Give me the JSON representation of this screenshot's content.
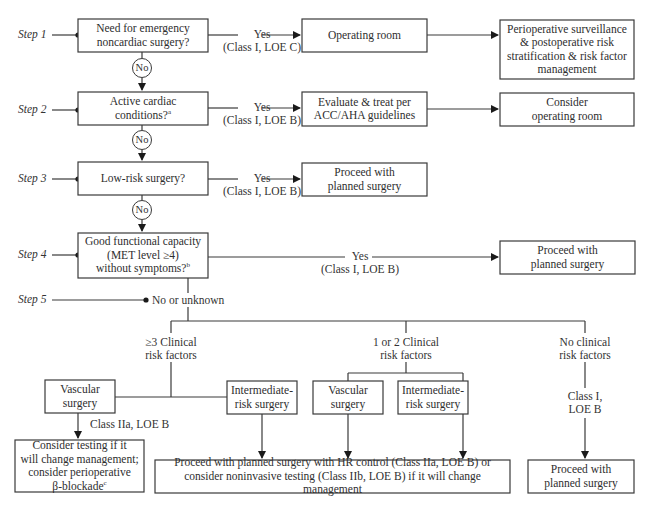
{
  "steps": [
    {
      "label": "Step 1"
    },
    {
      "label": "Step 2"
    },
    {
      "label": "Step 3"
    },
    {
      "label": "Step 4"
    },
    {
      "label": "Step 5"
    }
  ],
  "no_label": "No",
  "step1": {
    "question": [
      "Need for emergency",
      "noncardiac surgery?"
    ],
    "yes": "Yes",
    "evidence": "(Class I, LOE C)",
    "action": "Operating room",
    "outcome": [
      "Perioperative surveillance",
      "& postoperative risk",
      "stratification & risk factor",
      "management"
    ]
  },
  "step2": {
    "question": [
      "Active cardiac",
      "conditions?"
    ],
    "question_sup": "a",
    "yes": "Yes",
    "evidence": "(Class I, LOE B)",
    "action": [
      "Evaluate & treat per",
      "ACC/AHA guidelines"
    ],
    "outcome": [
      "Consider",
      "operating room"
    ]
  },
  "step3": {
    "question": "Low-risk surgery?",
    "yes": "Yes",
    "evidence": "(Class I, LOE B)",
    "action": [
      "Proceed with",
      "planned surgery"
    ]
  },
  "step4": {
    "question": [
      "Good functional capacity",
      "(MET level ≥4)",
      "without symptoms?"
    ],
    "question_sup": "b",
    "yes": "Yes",
    "evidence": "(Class I, LOE B)",
    "action": [
      "Proceed with",
      "planned surgery"
    ]
  },
  "step5": {
    "branch_label": "No or unknown",
    "groups": [
      {
        "label": [
          "≥3 Clinical",
          "risk factors"
        ],
        "vascular": [
          "Vascular",
          "surgery"
        ],
        "intermediate": [
          "Intermediate-",
          "risk surgery"
        ],
        "vascular_evidence": "Class IIa, LOE B",
        "vascular_outcome": [
          "Consider testing if it",
          "will change management;",
          "consider perioperative",
          "β-blockade"
        ],
        "vascular_outcome_sup": "c"
      },
      {
        "label": [
          "1 or 2 Clinical",
          "risk factors"
        ],
        "vascular": [
          "Vascular",
          "surgery"
        ],
        "intermediate": [
          "Intermediate-",
          "risk surgery"
        ]
      },
      {
        "label": [
          "No clinical",
          "risk factors"
        ],
        "evidence": [
          "Class I,",
          "LOE B"
        ],
        "outcome": [
          "Proceed with",
          "planned surgery"
        ]
      }
    ],
    "shared_outcome": [
      "Proceed with planned surgery with HR control (Class IIa, LOE B) or",
      "consider noninvasive testing (Class IIb, LOE B) if it will change management"
    ]
  }
}
